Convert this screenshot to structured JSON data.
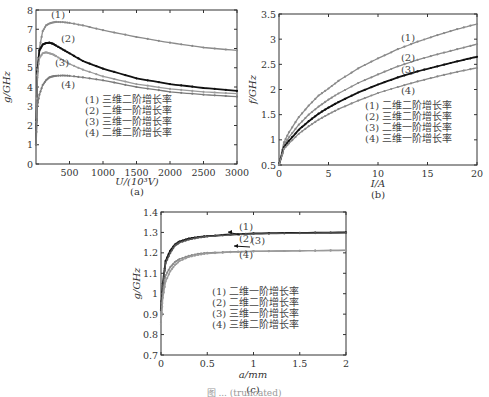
{
  "figure": {
    "caption_visible": "图 ... (truncated)"
  },
  "chart_data": [
    {
      "id": "a",
      "type": "line",
      "subtitle": "(a)",
      "xlabel": "U/(10³V)",
      "ylabel": "g/GHz",
      "xlim": [
        0,
        3000
      ],
      "ylim": [
        0,
        8
      ],
      "xticks": [
        500,
        1000,
        1500,
        2000,
        2500,
        3000
      ],
      "yticks": [
        0,
        1,
        2,
        3,
        4,
        5,
        6,
        7,
        8
      ],
      "grid": false,
      "legend": [
        "(1) 三维二阶增长率",
        "(2) 二维一阶增长率",
        "(3) 三维一阶增长率",
        "(4) 二维二阶增长率"
      ],
      "annotations": [
        "(1)",
        "(2)",
        "(3)",
        "(4)"
      ],
      "x": [
        0,
        20,
        50,
        100,
        150,
        200,
        250,
        300,
        400,
        500,
        700,
        1000,
        1500,
        2000,
        2500,
        3000
      ],
      "series": [
        {
          "name": "(1) 三维二阶增长率",
          "color": "#8a8a8a",
          "values": [
            1.0,
            4.5,
            6.0,
            6.9,
            7.2,
            7.3,
            7.35,
            7.38,
            7.37,
            7.33,
            7.2,
            6.95,
            6.6,
            6.3,
            6.05,
            5.9
          ]
        },
        {
          "name": "(2) 二维一阶增长率",
          "color": "#111111",
          "values": [
            1.0,
            4.8,
            5.9,
            6.2,
            6.28,
            6.3,
            6.25,
            6.15,
            5.95,
            5.75,
            5.35,
            4.95,
            4.45,
            4.15,
            3.95,
            3.8
          ]
        },
        {
          "name": "(3) 三维一阶增长率",
          "color": "#9a9a9a",
          "values": [
            1.0,
            4.6,
            5.5,
            5.75,
            5.8,
            5.75,
            5.7,
            5.6,
            5.4,
            5.2,
            4.9,
            4.55,
            4.15,
            3.9,
            3.75,
            3.65
          ]
        },
        {
          "name": "(4) 二维二阶增长率",
          "color": "#7a7a7a",
          "values": [
            1.0,
            3.0,
            3.6,
            4.1,
            4.35,
            4.5,
            4.55,
            4.58,
            4.6,
            4.58,
            4.5,
            4.35,
            4.0,
            3.75,
            3.6,
            3.5
          ]
        }
      ]
    },
    {
      "id": "b",
      "type": "line",
      "subtitle": "(b)",
      "xlabel": "I/A",
      "ylabel": "f/GHz",
      "xlim": [
        0,
        20
      ],
      "ylim": [
        0.5,
        3.5
      ],
      "xticks": [
        0,
        5,
        10,
        15,
        20
      ],
      "yticks": [
        0.5,
        1,
        1.5,
        2,
        2.5,
        3,
        3.5
      ],
      "grid": false,
      "legend": [
        "(1) 二维二阶增长率",
        "(2) 三维二阶增长率",
        "(3) 二维一阶增长率",
        "(4) 三维一阶增长率"
      ],
      "annotations": [
        "(1)",
        "(2)",
        "(3)",
        "(4)"
      ],
      "x": [
        0,
        0.5,
        1,
        2,
        3,
        4,
        5,
        6,
        8,
        10,
        12,
        14,
        16,
        18,
        20
      ],
      "series": [
        {
          "name": "(1) 二维二阶增长率",
          "color": "#8a8a8a",
          "values": [
            0.5,
            0.95,
            1.15,
            1.45,
            1.68,
            1.88,
            2.02,
            2.17,
            2.42,
            2.62,
            2.8,
            2.95,
            3.08,
            3.2,
            3.3
          ]
        },
        {
          "name": "(2) 三维二阶增长率",
          "color": "#8a8a8a",
          "values": [
            0.5,
            0.9,
            1.05,
            1.3,
            1.5,
            1.66,
            1.8,
            1.92,
            2.13,
            2.3,
            2.46,
            2.59,
            2.7,
            2.8,
            2.9
          ]
        },
        {
          "name": "(3) 二维一阶增长率",
          "color": "#111111",
          "values": [
            0.5,
            0.85,
            0.98,
            1.2,
            1.37,
            1.52,
            1.64,
            1.75,
            1.94,
            2.1,
            2.24,
            2.36,
            2.46,
            2.56,
            2.65
          ]
        },
        {
          "name": "(4) 三维一阶增长率",
          "color": "#8a8a8a",
          "values": [
            0.5,
            0.82,
            0.93,
            1.12,
            1.27,
            1.4,
            1.51,
            1.61,
            1.78,
            1.93,
            2.05,
            2.16,
            2.26,
            2.35,
            2.43
          ]
        }
      ]
    },
    {
      "id": "c",
      "type": "line",
      "subtitle": "(c)",
      "xlabel": "a/mm",
      "ylabel": "g/GHz",
      "xlim": [
        0,
        2
      ],
      "ylim": [
        0.7,
        1.4
      ],
      "xticks": [
        0,
        0.5,
        1,
        1.5,
        2
      ],
      "yticks": [
        0.7,
        0.8,
        0.9,
        1,
        1.1,
        1.2,
        1.3,
        1.4
      ],
      "grid": false,
      "legend": [
        "(1) 二维一阶增长率",
        "(2) 二维二阶增长率",
        "(3) 三维一阶增长率",
        "(4) 三维二阶增长率"
      ],
      "annotations": [
        "(1)",
        "(2)",
        "(3)",
        "(4)"
      ],
      "x": [
        0,
        0.02,
        0.05,
        0.1,
        0.15,
        0.2,
        0.3,
        0.4,
        0.5,
        0.75,
        1,
        1.5,
        2
      ],
      "series": [
        {
          "name": "(1) 二维一阶增长率",
          "color": "#111111",
          "values": [
            0.92,
            1.05,
            1.16,
            1.21,
            1.24,
            1.255,
            1.27,
            1.277,
            1.282,
            1.29,
            1.295,
            1.298,
            1.3
          ]
        },
        {
          "name": "(2) 二维二阶增长率",
          "color": "#555555",
          "values": [
            0.92,
            1.04,
            1.15,
            1.2,
            1.235,
            1.25,
            1.265,
            1.274,
            1.28,
            1.288,
            1.293,
            1.296,
            1.298
          ]
        },
        {
          "name": "(3) 三维一阶增长率",
          "color": "#8a8a8a",
          "values": [
            0.86,
            1.0,
            1.09,
            1.13,
            1.155,
            1.17,
            1.185,
            1.195,
            1.2,
            1.205,
            1.208,
            1.21,
            1.212
          ]
        },
        {
          "name": "(4) 三维二阶增长率",
          "color": "#9a9a9a",
          "values": [
            0.85,
            0.98,
            1.06,
            1.11,
            1.14,
            1.16,
            1.18,
            1.19,
            1.197,
            1.203,
            1.207,
            1.21,
            1.213
          ]
        }
      ]
    }
  ]
}
